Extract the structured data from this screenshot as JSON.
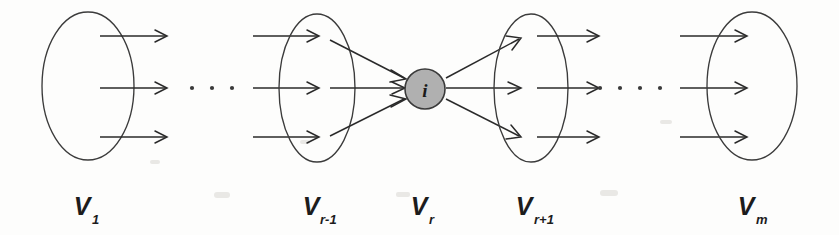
{
  "figure": {
    "type": "layered-set-diagram",
    "background_color": "#fdfdfc",
    "stroke_color": "#2a2a2a",
    "node_fill_color": "#b0b0b0",
    "node_stroke_color": "#3a3a3a"
  },
  "center_node": {
    "label": "i",
    "cx": 425,
    "cy": 89,
    "r": 20,
    "in_degree": 3,
    "out_degree": 3
  },
  "sets": [
    {
      "id": "V1",
      "label_main": "V",
      "label_sub": "1",
      "label_text": "V1",
      "cx": 88,
      "cy": 86,
      "rx": 46,
      "ry": 74,
      "label_x": 88,
      "label_y": 215,
      "arrow_count": 3
    },
    {
      "id": "Vr-1",
      "label_main": "V",
      "label_sub": "r-1",
      "label_text": "Vr-1",
      "cx": 317,
      "cy": 88,
      "rx": 38,
      "ry": 74,
      "label_x": 317,
      "label_y": 215,
      "arrow_count": 3
    },
    {
      "id": "Vr",
      "label_main": "V",
      "label_sub": "r",
      "label_text": "Vr",
      "cx": 425,
      "cy": 89,
      "rx": 20,
      "ry": 20,
      "label_x": 425,
      "label_y": 215,
      "arrow_count": 0
    },
    {
      "id": "Vr+1",
      "label_main": "V",
      "label_sub": "r+1",
      "label_text": "Vr+1",
      "cx": 531,
      "cy": 88,
      "rx": 37,
      "ry": 74,
      "label_x": 531,
      "label_y": 215,
      "arrow_count": 3
    },
    {
      "id": "Vm",
      "label_main": "V",
      "label_sub": "m",
      "label_text": "Vm",
      "cx": 752,
      "cy": 86,
      "rx": 45,
      "ry": 74,
      "label_x": 752,
      "label_y": 215,
      "arrow_count": 3
    }
  ],
  "ellipses_separators": [
    {
      "id": "left-ellipsis",
      "dots": 3,
      "cx": [
        192,
        212,
        232
      ],
      "cy": 88,
      "r": 2
    },
    {
      "id": "right-ellipsis",
      "dots": 4,
      "cx": [
        600,
        620,
        640,
        660
      ],
      "cy": 88,
      "r": 2
    }
  ],
  "edge_rows_y": [
    42,
    88,
    133
  ]
}
